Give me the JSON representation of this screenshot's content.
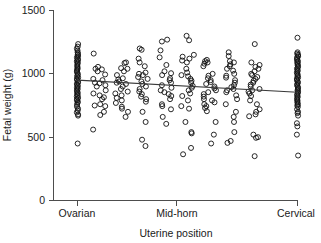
{
  "chart_data": {
    "type": "scatter",
    "title": "",
    "xlabel": "Uterine position",
    "ylabel": "Fetal weight (g)",
    "xlim": [
      0,
      10
    ],
    "ylim": [
      0,
      1500
    ],
    "yticks": [
      0,
      500,
      1000,
      1500
    ],
    "ytick_labels": [
      "0",
      "500",
      "1000",
      "1500"
    ],
    "xticks": [
      0,
      5,
      10
    ],
    "xtick_labels": [
      "Ovarian",
      "Mid-horn",
      "Cervical"
    ],
    "grid": false,
    "legend": "none",
    "axis_color": "#4d4d4d",
    "point_color": "#111111",
    "line_color": "#3a3a3a",
    "marker": "open-circle",
    "fit_line": {
      "name": "linear regression",
      "x": [
        0,
        10
      ],
      "y": [
        950,
        855
      ],
      "intercept": 950,
      "slope": -9.5
    },
    "series": [
      {
        "name": "Ovarian",
        "x_position": 0,
        "values": [
          1235,
          1215,
          1200,
          1185,
          1170,
          1160,
          1150,
          1140,
          1130,
          1120,
          1110,
          1100,
          1090,
          1080,
          1070,
          1060,
          1050,
          1040,
          1030,
          1020,
          1010,
          1000,
          990,
          980,
          970,
          960,
          950,
          940,
          930,
          920,
          910,
          900,
          890,
          880,
          870,
          860,
          850,
          840,
          830,
          820,
          810,
          800,
          790,
          780,
          770,
          755,
          740,
          725,
          710,
          695,
          680,
          670,
          450
        ]
      },
      {
        "name": "Position 1",
        "x_position": 1,
        "values": [
          1160,
          1055,
          1040,
          1035,
          1020,
          995,
          960,
          950,
          930,
          925,
          910,
          900,
          870,
          845,
          830,
          815,
          800,
          760,
          750,
          745,
          700,
          675,
          560
        ]
      },
      {
        "name": "Position 2",
        "x_position": 2,
        "values": [
          1090,
          1085,
          1045,
          1040,
          1020,
          990,
          965,
          955,
          940,
          930,
          920,
          900,
          880,
          860,
          845,
          830,
          810,
          790,
          770,
          740,
          725,
          700,
          660
        ]
      },
      {
        "name": "Position 3",
        "x_position": 3,
        "values": [
          1200,
          1190,
          1120,
          1090,
          1060,
          1010,
          1000,
          990,
          975,
          960,
          940,
          920,
          900,
          880,
          860,
          840,
          820,
          800,
          780,
          700,
          620,
          480,
          430
        ]
      },
      {
        "name": "Position 4",
        "x_position": 4,
        "values": [
          1270,
          1255,
          1185,
          1130,
          1070,
          1020,
          1005,
          990,
          965,
          950,
          930,
          910,
          890,
          870,
          855,
          840,
          825,
          800,
          760,
          745,
          720,
          660,
          605
        ]
      },
      {
        "name": "Position 5",
        "x_position": 5,
        "values": [
          1300,
          1265,
          1150,
          1135,
          1120,
          1105,
          1090,
          1040,
          1010,
          990,
          980,
          960,
          945,
          930,
          905,
          890,
          870,
          845,
          825,
          790,
          745,
          725,
          620,
          540,
          530,
          415,
          365
        ]
      },
      {
        "name": "Position 6",
        "x_position": 6,
        "values": [
          1110,
          1100,
          1090,
          1080,
          1060,
          1000,
          985,
          965,
          950,
          935,
          920,
          900,
          885,
          870,
          855,
          840,
          820,
          800,
          790,
          775,
          760,
          745,
          730,
          705,
          620,
          520,
          450
        ]
      },
      {
        "name": "Position 7",
        "x_position": 7,
        "values": [
          1170,
          1140,
          1100,
          1090,
          1075,
          1060,
          1040,
          1025,
          1000,
          985,
          970,
          950,
          930,
          910,
          895,
          880,
          870,
          855,
          830,
          800,
          760,
          700,
          660,
          620,
          540,
          470,
          455
        ]
      },
      {
        "name": "Position 8",
        "x_position": 8,
        "values": [
          1235,
          1090,
          1070,
          1055,
          1040,
          1020,
          1000,
          990,
          975,
          960,
          945,
          930,
          915,
          900,
          880,
          870,
          860,
          845,
          825,
          790,
          760,
          720,
          700,
          680,
          665,
          520,
          500,
          495,
          350
        ]
      },
      {
        "name": "Cervical",
        "x_position": 10,
        "values": [
          1285,
          1170,
          1160,
          1150,
          1140,
          1130,
          1120,
          1110,
          1100,
          1090,
          1080,
          1070,
          1060,
          1050,
          1040,
          1030,
          1020,
          1010,
          1000,
          990,
          980,
          970,
          960,
          950,
          940,
          930,
          920,
          910,
          900,
          890,
          880,
          870,
          860,
          850,
          840,
          830,
          820,
          810,
          800,
          790,
          780,
          770,
          760,
          750,
          740,
          720,
          700,
          690,
          670,
          610,
          585,
          520,
          355
        ]
      }
    ]
  }
}
